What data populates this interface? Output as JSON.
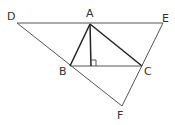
{
  "diagram": {
    "type": "geometry",
    "points": {
      "D": {
        "label": "D",
        "x": 17,
        "y": 23,
        "lx": 7,
        "ly": 20
      },
      "A": {
        "label": "A",
        "x": 90,
        "y": 24,
        "lx": 86,
        "ly": 17
      },
      "E": {
        "label": "E",
        "x": 163,
        "y": 23,
        "lx": 162,
        "ly": 22
      },
      "B": {
        "label": "B",
        "x": 70,
        "y": 66,
        "lx": 59,
        "ly": 75
      },
      "C": {
        "label": "C",
        "x": 142,
        "y": 66,
        "lx": 144,
        "ly": 75
      },
      "F": {
        "label": "F",
        "x": 122,
        "y": 106,
        "lx": 117,
        "ly": 119
      },
      "H": {
        "x": 91,
        "y": 66
      }
    },
    "segments": [
      [
        "D",
        "E"
      ],
      [
        "D",
        "F"
      ],
      [
        "E",
        "F"
      ],
      [
        "A",
        "B"
      ],
      [
        "A",
        "C"
      ],
      [
        "B",
        "C"
      ],
      [
        "A",
        "H"
      ]
    ],
    "right_angle_mark": {
      "at": "H",
      "note": "AH ⟂ BC"
    },
    "labels": [
      "D",
      "A",
      "E",
      "B",
      "C",
      "F"
    ]
  }
}
